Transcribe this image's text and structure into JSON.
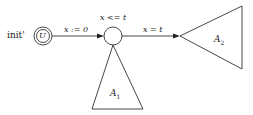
{
  "diagram": {
    "type": "timed automaton",
    "initial_state": {
      "label": "init'",
      "symbol": "U"
    },
    "middle_state": {
      "invariant": "x <= t"
    },
    "edges": [
      {
        "from": "init'",
        "to": "middle",
        "guard": "x := 0"
      },
      {
        "from": "middle",
        "to": "A2",
        "guard": "x = t"
      }
    ],
    "subautomata": [
      {
        "name": "A",
        "index": "1"
      },
      {
        "name": "A",
        "index": "2"
      }
    ]
  },
  "labels": {
    "init": "init'",
    "urgent_symbol": "U",
    "edge1": "x := 0",
    "invariant": "x <= t",
    "edge2": "x = t",
    "a1_name": "A",
    "a1_sub": "1",
    "a2_name": "A",
    "a2_sub": "2"
  }
}
